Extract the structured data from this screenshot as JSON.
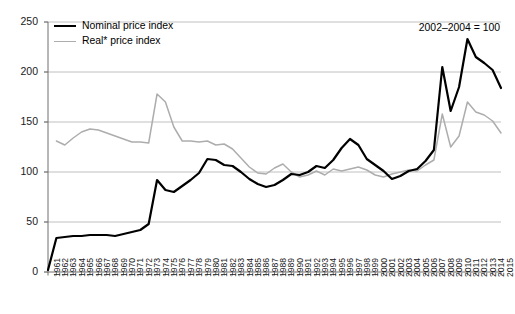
{
  "chart_data": {
    "type": "line",
    "title": "",
    "annotation": "2002–2004 = 100",
    "xlabel": "",
    "ylabel": "",
    "ylim": [
      0,
      250
    ],
    "yticks": [
      0,
      50,
      100,
      150,
      200,
      250
    ],
    "grid": true,
    "legend_position": "top-left",
    "x": [
      1961,
      1962,
      1963,
      1964,
      1965,
      1966,
      1967,
      1968,
      1969,
      1970,
      1971,
      1972,
      1973,
      1974,
      1975,
      1976,
      1977,
      1978,
      1979,
      1980,
      1981,
      1982,
      1983,
      1984,
      1985,
      1986,
      1987,
      1988,
      1989,
      1990,
      1991,
      1992,
      1993,
      1994,
      1995,
      1996,
      1997,
      1998,
      1999,
      2000,
      2001,
      2002,
      2003,
      2004,
      2005,
      2006,
      2007,
      2008,
      2009,
      2010,
      2011,
      2012,
      2013,
      2014,
      2015
    ],
    "series": [
      {
        "name": "Nominal price index",
        "color": "#000000",
        "values": [
          2,
          34,
          35,
          36,
          36,
          37,
          37,
          37,
          36,
          38,
          40,
          42,
          48,
          92,
          82,
          80,
          86,
          92,
          99,
          113,
          112,
          107,
          106,
          100,
          93,
          88,
          85,
          87,
          92,
          98,
          97,
          100,
          106,
          104,
          112,
          124,
          133,
          127,
          113,
          107,
          101,
          93,
          96,
          101,
          103,
          111,
          122,
          205,
          161,
          185,
          233,
          215,
          209,
          202,
          184
        ]
      },
      {
        "name": "Real* price index",
        "color": "#adadad",
        "values": [
          null,
          131,
          127,
          134,
          140,
          143,
          142,
          139,
          136,
          133,
          130,
          130,
          129,
          178,
          170,
          145,
          131,
          131,
          130,
          131,
          127,
          128,
          123,
          114,
          105,
          99,
          98,
          104,
          108,
          100,
          95,
          97,
          101,
          97,
          103,
          101,
          103,
          105,
          102,
          97,
          95,
          98,
          100,
          102,
          101,
          107,
          112,
          158,
          125,
          136,
          170,
          160,
          157,
          151,
          139
        ]
      }
    ]
  },
  "legend": {
    "items": [
      {
        "label": "Nominal price index",
        "swatch": "nominal-line-swatch"
      },
      {
        "label": "Real* price index",
        "swatch": "real-line-swatch"
      }
    ]
  },
  "axes": {
    "y_tick_labels": [
      "250",
      "200",
      "150",
      "100",
      "50",
      "0"
    ],
    "x_tick_labels": [
      "1961",
      "1962",
      "1963",
      "1964",
      "1965",
      "1966",
      "1967",
      "1968",
      "1969",
      "1970",
      "1971",
      "1972",
      "1973",
      "1974",
      "1975",
      "1976",
      "1977",
      "1978",
      "1979",
      "1980",
      "1981",
      "1982",
      "1983",
      "1984",
      "1985",
      "1986",
      "1987",
      "1988",
      "1989",
      "1990",
      "1991",
      "1992",
      "1993",
      "1994",
      "1995",
      "1996",
      "1997",
      "1998",
      "1999",
      "2000",
      "2001",
      "2002",
      "2003",
      "2004",
      "2005",
      "2006",
      "2007",
      "2008",
      "2009",
      "2010",
      "2011",
      "2012",
      "2013",
      "2014",
      "2015"
    ]
  }
}
